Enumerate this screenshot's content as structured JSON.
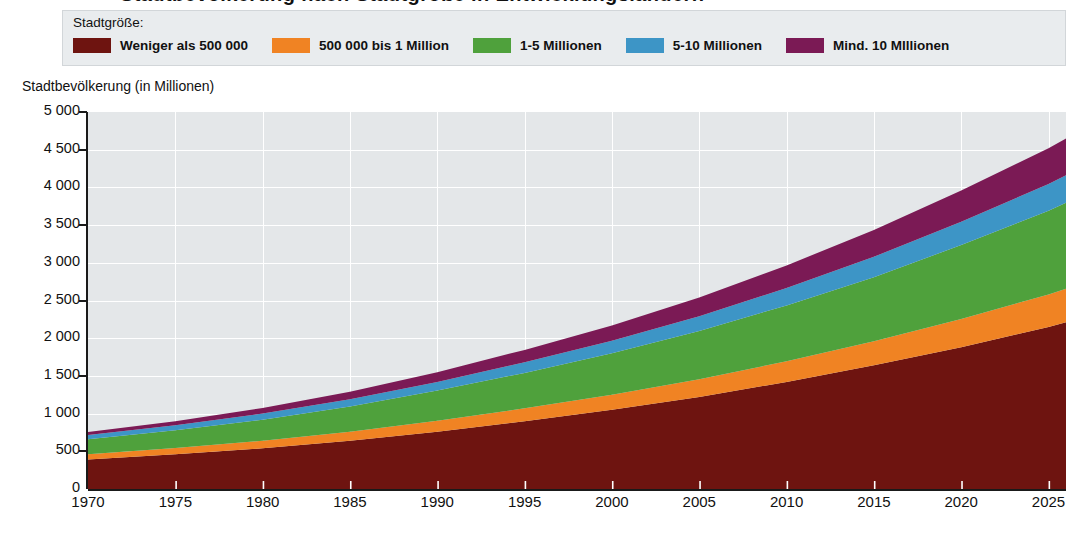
{
  "title": "Stadtbevölkerung nach Stadtgröße in Entwicklungsländern",
  "legend": {
    "heading": "Stadtgröße:",
    "items": [
      {
        "label": "Weniger als 500 000",
        "color": "#6E1410",
        "name": "legend-item-under-500000"
      },
      {
        "label": "500 000 bis 1 Million",
        "color": "#F08323",
        "name": "legend-item-500000-1m"
      },
      {
        "label": "1-5 Millionen",
        "color": "#4FA13C",
        "name": "legend-item-1-5m"
      },
      {
        "label": "5-10 Millionen",
        "color": "#3D95C6",
        "name": "legend-item-5-10m"
      },
      {
        "label": "Mind. 10 MIllionen",
        "color": "#7B1A55",
        "name": "legend-item-min-10m"
      }
    ]
  },
  "axis": {
    "y_title": "Stadtbevölkerung (in Millionen)",
    "y_ticks": [
      "5 000",
      "4 500",
      "4 000",
      "3 500",
      "3 000",
      "2 500",
      "2 000",
      "1 500",
      "1 000",
      "500",
      "0"
    ],
    "x_ticks": [
      "1970",
      "1975",
      "1980",
      "1985",
      "1990",
      "1995",
      "2000",
      "2005",
      "2010",
      "2015",
      "2020",
      "2025"
    ]
  },
  "chart_data": {
    "type": "area",
    "stacked": true,
    "title": "Stadtbevölkerung nach Stadtgröße in Entwicklungsländern",
    "xlabel": "",
    "ylabel": "Stadtbevölkerung (in Millionen)",
    "xlim": [
      1970,
      2026
    ],
    "ylim": [
      0,
      5000
    ],
    "ytick_step": 500,
    "xtick_step": 5,
    "grid": true,
    "legend_position": "top",
    "x": [
      1970,
      1975,
      1980,
      1985,
      1990,
      1995,
      2000,
      2005,
      2010,
      2015,
      2020,
      2025,
      2026
    ],
    "series": [
      {
        "name": "Weniger als 500 000",
        "color": "#6E1410",
        "values": [
          390,
          460,
          540,
          640,
          760,
          900,
          1050,
          1220,
          1420,
          1640,
          1880,
          2150,
          2210
        ]
      },
      {
        "name": "500 000 bis 1 Million",
        "color": "#F08323",
        "values": [
          70,
          85,
          100,
          120,
          145,
          170,
          200,
          235,
          275,
          320,
          375,
          430,
          445
        ]
      },
      {
        "name": "1-5 Millionen",
        "color": "#4FA13C",
        "values": [
          200,
          235,
          280,
          335,
          400,
          470,
          550,
          640,
          740,
          850,
          980,
          1110,
          1140
        ]
      },
      {
        "name": "5-10 Millionen",
        "color": "#3D95C6",
        "values": [
          55,
          65,
          80,
          95,
          115,
          140,
          165,
          195,
          230,
          270,
          310,
          355,
          365
        ]
      },
      {
        "name": "Mind. 10 MIllionen",
        "color": "#7B1A55",
        "values": [
          40,
          55,
          75,
          100,
          130,
          165,
          205,
          250,
          300,
          355,
          415,
          475,
          490
        ]
      }
    ],
    "totals": [
      755,
      900,
      1075,
      1290,
      1550,
      1845,
      2170,
      2540,
      2965,
      3435,
      3960,
      4520,
      4650
    ]
  }
}
